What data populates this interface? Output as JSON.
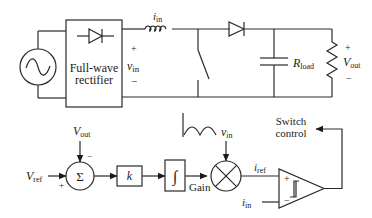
{
  "power_stage": {
    "source": {
      "icon": "ac-source-icon"
    },
    "rectifier": {
      "label_line1": "Full-wave",
      "label_line2": "rectifier",
      "icon": "diode-icon"
    },
    "vin": {
      "plus": "+",
      "symbol": "v",
      "sub": "in",
      "minus": "−"
    },
    "inductor": {
      "current_symbol": "i",
      "current_sub": "in"
    },
    "switch": {
      "icon": "switch-icon"
    },
    "output_diode": {
      "icon": "diode-icon"
    },
    "capacitor": {
      "icon": "capacitor-icon"
    },
    "rload": {
      "symbol": "R",
      "sub": "load"
    },
    "vout": {
      "plus": "+",
      "symbol": "V",
      "sub": "out",
      "minus": "−"
    }
  },
  "control": {
    "vref": {
      "symbol": "V",
      "sub": "ref",
      "sign": "+"
    },
    "vout_fb": {
      "symbol": "V",
      "sub": "out",
      "sign": "−"
    },
    "summer": {
      "symbol": "Σ"
    },
    "gain_block": {
      "symbol": "k"
    },
    "integrator": {
      "symbol": "∫"
    },
    "multiplier": {
      "label": "Gain",
      "icon": "multiplier-icon"
    },
    "vin_ref": {
      "symbol": "v",
      "sub": "in",
      "waveform_icon": "rectified-sine-icon"
    },
    "iref": {
      "symbol": "i",
      "sub": "ref"
    },
    "iin": {
      "symbol": "i",
      "sub": "in"
    },
    "comparator": {
      "plus": "+",
      "minus": "−",
      "icon": "hysteresis-icon"
    },
    "switch_control": {
      "line1": "Switch",
      "line2": "control"
    }
  }
}
